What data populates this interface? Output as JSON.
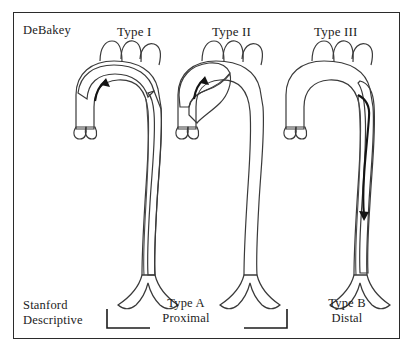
{
  "figure": {
    "classification_systems": {
      "row_label_top": "DeBakey",
      "row_label_bottom_line1": "Stanford",
      "row_label_bottom_line2": "Descriptive"
    },
    "debakey_types": [
      {
        "id": "type-1",
        "label": "Type I"
      },
      {
        "id": "type-2",
        "label": "Type II"
      },
      {
        "id": "type-3",
        "label": "Type III"
      }
    ],
    "stanford_groups": [
      {
        "id": "type-a",
        "line1": "Type A",
        "line2": "Proximal",
        "spans": "Type I and Type II"
      },
      {
        "id": "type-b",
        "line1": "Type B",
        "line2": "Distal",
        "spans": "Type III"
      }
    ],
    "anatomy": {
      "arch_branch_count": 3,
      "arch_branch_names": [
        "brachiocephalic-artery",
        "left-common-carotid-artery",
        "left-subclavian-artery"
      ],
      "bifurcation_name": "iliac-bifurcation"
    },
    "dissection_extent": {
      "type-1": "ascending aorta, arch and descending aorta",
      "type-2": "ascending aorta only",
      "type-3": "descending aorta only"
    },
    "arrows": {
      "type-1": "ascending-arch-arrow",
      "type-2": "ascending-arch-arrow",
      "type-3": "descending-aorta-arrow"
    },
    "colors": {
      "frame": "#2b2b2b",
      "background": "#ffffff",
      "vessel_light": "#b4b4b4",
      "vessel_mid": "#9a9a9a",
      "false_lumen_dark": "#6f6f6f",
      "outline": "#3a3a3a",
      "text": "#1c1c1c"
    }
  }
}
